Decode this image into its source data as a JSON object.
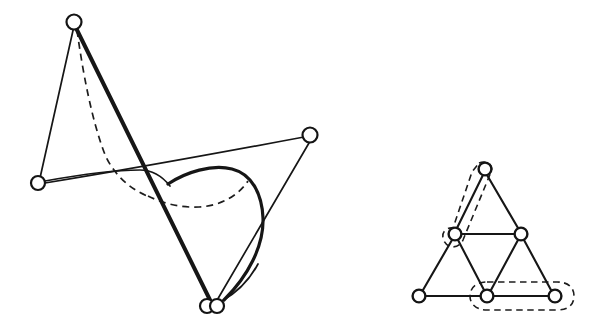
{
  "figure": {
    "background_color": "#ffffff",
    "stroke_color": "#161616",
    "node_fill_color": "#ffffff",
    "width": 600,
    "height": 331,
    "panels": [
      {
        "id": "left-panel",
        "name": "embedded-graph-with-crossing-curve",
        "description": "Four-node graph drawn with straight edges, one bold edge, and a solid plus dashed curve passing through the drawing",
        "nodes": [
          {
            "id": "n-top",
            "label": "top vertex",
            "x": 74,
            "y": 22,
            "r": 7.5
          },
          {
            "id": "n-left",
            "label": "left vertex",
            "x": 38,
            "y": 183,
            "r": 7.0
          },
          {
            "id": "n-right",
            "label": "right vertex",
            "x": 310,
            "y": 135,
            "r": 7.5
          },
          {
            "id": "n-bottom",
            "label": "bottom vertex",
            "x": 206,
            "y": 307,
            "r": 7.0
          },
          {
            "id": "n-bottom2",
            "label": "bottom vertex twin",
            "x": 216,
            "y": 307,
            "r": 7.0
          }
        ],
        "edges": [
          {
            "id": "e-top-left",
            "from": "n-top",
            "to": "n-left",
            "style": "thin"
          },
          {
            "id": "e-top-bottom",
            "from": "n-top",
            "to": "n-bottom",
            "style": "thick"
          },
          {
            "id": "e-left-right",
            "from": "n-left",
            "to": "n-right",
            "style": "thin"
          },
          {
            "id": "e-right-bottom",
            "from": "n-right",
            "to": "n-bottom",
            "style": "thin"
          }
        ],
        "curves": [
          {
            "id": "c-solid-loop",
            "style": "solid",
            "description": "bold curve from mid-left sweeping right and down to bottom vertex"
          },
          {
            "id": "c-dashed-arc",
            "style": "dashed",
            "description": "dashed arc under the solid loop"
          },
          {
            "id": "c-dashed-top",
            "style": "dashed",
            "description": "dashed curve from top vertex down to crossing point"
          }
        ]
      },
      {
        "id": "right-panel",
        "name": "triangulated-triangle-graph",
        "description": "Triangle subdivided into four smaller triangles; two edges enclosed by dashed rounded outlines",
        "nodes": [
          {
            "id": "t-apex",
            "label": "apex",
            "x": 485,
            "y": 169,
            "r": 6.4
          },
          {
            "id": "t-mid-left",
            "label": "mid left",
            "x": 455,
            "y": 234,
            "r": 6.4
          },
          {
            "id": "t-mid-right",
            "label": "mid right",
            "x": 521,
            "y": 234,
            "r": 6.4
          },
          {
            "id": "t-bottom-left",
            "label": "bottom left",
            "x": 419,
            "y": 296,
            "r": 6.4
          },
          {
            "id": "t-bottom-mid",
            "label": "bottom middle",
            "x": 487,
            "y": 296,
            "r": 6.4
          },
          {
            "id": "t-bottom-right",
            "label": "bottom right",
            "x": 555,
            "y": 296,
            "r": 6.4
          }
        ],
        "edges": [
          {
            "id": "r-apex-ml",
            "from": "t-apex",
            "to": "t-mid-left"
          },
          {
            "id": "r-apex-mr",
            "from": "t-apex",
            "to": "t-mid-right"
          },
          {
            "id": "r-ml-mr",
            "from": "t-mid-left",
            "to": "t-mid-right"
          },
          {
            "id": "r-ml-bl",
            "from": "t-mid-left",
            "to": "t-bottom-left"
          },
          {
            "id": "r-ml-bm",
            "from": "t-mid-left",
            "to": "t-bottom-mid"
          },
          {
            "id": "r-mr-bm",
            "from": "t-mid-right",
            "to": "t-bottom-mid"
          },
          {
            "id": "r-mr-br",
            "from": "t-mid-right",
            "to": "t-bottom-right"
          },
          {
            "id": "r-bl-bm",
            "from": "t-bottom-left",
            "to": "t-bottom-mid"
          },
          {
            "id": "r-bm-br",
            "from": "t-bottom-mid",
            "to": "t-bottom-right"
          }
        ],
        "highlight_regions": [
          {
            "id": "h-apex-midleft",
            "label": "dashed outline around apex-to-mid-left edge",
            "style": "dashed-rounded"
          },
          {
            "id": "h-bottom-right",
            "label": "dashed outline around bottom-middle-to-right edge",
            "style": "dashed-rounded"
          }
        ]
      }
    ]
  }
}
